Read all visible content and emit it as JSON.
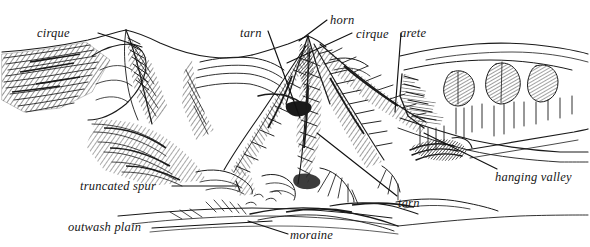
{
  "figure": {
    "background_color": "#ffffff",
    "ink_color": "#1a1a1a",
    "width": 590,
    "height": 247,
    "style": "pen-and-ink hatched line drawing"
  },
  "labels": [
    {
      "id": "cirque-left",
      "text": "cirque",
      "x": 37,
      "y": 27,
      "anchor": "start"
    },
    {
      "id": "tarn-top",
      "text": "tarn",
      "x": 240,
      "y": 27,
      "anchor": "start"
    },
    {
      "id": "horn",
      "text": "horn",
      "x": 330,
      "y": 15,
      "anchor": "start"
    },
    {
      "id": "cirque-center",
      "text": "cirque",
      "x": 356,
      "y": 29,
      "anchor": "start"
    },
    {
      "id": "arete",
      "text": "arete",
      "x": 400,
      "y": 28,
      "anchor": "start"
    },
    {
      "id": "hanging-valley",
      "text": "hanging valley",
      "x": 495,
      "y": 172,
      "anchor": "start"
    },
    {
      "id": "truncated-spur",
      "text": "truncated spur",
      "x": 80,
      "y": 181,
      "anchor": "start"
    },
    {
      "id": "tarn-bottom",
      "text": "tarn",
      "x": 398,
      "y": 198,
      "anchor": "start"
    },
    {
      "id": "outwash-plain",
      "text": "outwash plain",
      "x": 68,
      "y": 222,
      "anchor": "start"
    },
    {
      "id": "moraine",
      "text": "moraine",
      "x": 290,
      "y": 230,
      "anchor": "start"
    }
  ],
  "leader_lines": [
    {
      "id": "leader-cirque-left",
      "from_label": "cirque",
      "points": "98,33 142,47"
    },
    {
      "id": "leader-tarn-top",
      "from_label": "tarn",
      "points": "268,31 300,118"
    },
    {
      "id": "leader-horn",
      "from_label": "horn",
      "points": "327,20 300,40"
    },
    {
      "id": "leader-cirque-center",
      "from_label": "cirque",
      "points": "353,33 288,63"
    },
    {
      "id": "leader-arete",
      "from_label": "arete",
      "points": "400,33 395,110"
    },
    {
      "id": "leader-hanging-valley",
      "from_label": "hanging valley",
      "points": "497,169 425,133"
    },
    {
      "id": "leader-truncated-spur",
      "from_label": "truncated spur",
      "points": "172,186 237,186"
    },
    {
      "id": "leader-tarn-bottom",
      "from_label": "tarn",
      "points": "398,196 318,133"
    },
    {
      "id": "leader-outwash-plain",
      "from_label": "outwash plain",
      "points": "152,228 270,222"
    },
    {
      "id": "leader-moraine",
      "from_label": "moraine",
      "points": "288,234 250,222"
    }
  ],
  "landform_terms": [
    "cirque",
    "tarn",
    "horn",
    "arete",
    "hanging valley",
    "truncated spur",
    "outwash plain",
    "moraine"
  ]
}
